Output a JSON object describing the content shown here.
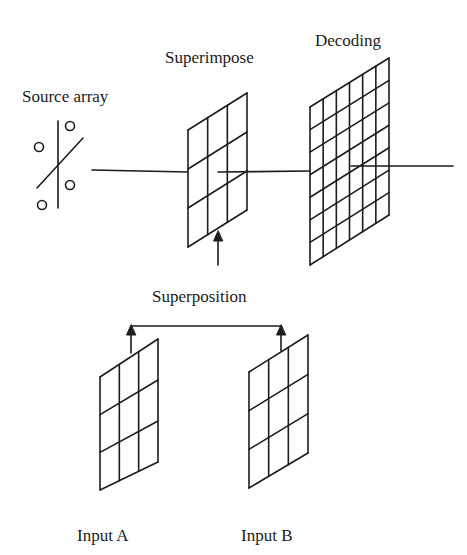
{
  "labels": {
    "source_array": "Source array",
    "superimpose": "Superimpose",
    "decoding": "Decoding",
    "superposition": "Superposition",
    "input_a": "Input A",
    "input_b": "Input B"
  },
  "grids": {
    "superimpose": {
      "columns": 3,
      "rows": 3
    },
    "decoding": {
      "columns": 6,
      "rows": 7
    },
    "input_a": {
      "columns": 3,
      "rows": 3
    },
    "input_b": {
      "columns": 3,
      "rows": 3
    }
  },
  "source_array": {
    "circles": 4
  },
  "colors": {
    "ink": "#1c1c1c",
    "background": "#ffffff"
  }
}
